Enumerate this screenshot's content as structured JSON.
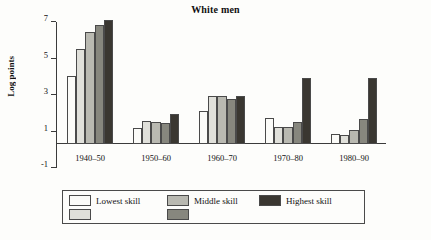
{
  "chart_data": {
    "type": "bar",
    "title": "White men",
    "xlabel": "",
    "ylabel": "Log points",
    "ylim": [
      -1,
      7
    ],
    "yticks": [
      -1,
      1,
      3,
      5,
      7
    ],
    "ytick_labels": [
      "-1",
      "1",
      "3",
      "5",
      "7"
    ],
    "grid": false,
    "legend_position": "bottom",
    "categories": [
      "1940–50",
      "1950–60",
      "1960–70",
      "1970–80",
      "1980–90"
    ],
    "series": [
      {
        "name": "Lowest skill",
        "color": "#fbfbf8",
        "values": [
          3.7,
          0.85,
          1.8,
          1.4,
          0.55
        ]
      },
      {
        "name": "Skill 2",
        "color": "#e0e0da",
        "values": [
          5.2,
          1.25,
          2.6,
          0.9,
          0.45
        ]
      },
      {
        "name": "Middle skill",
        "color": "#b9b9b1",
        "values": [
          6.1,
          1.2,
          2.6,
          0.9,
          0.75
        ]
      },
      {
        "name": "Skill 4",
        "color": "#87877e",
        "values": [
          6.5,
          1.15,
          2.45,
          1.2,
          1.35
        ]
      },
      {
        "name": "Highest skill",
        "color": "#3a3731",
        "values": [
          6.8,
          1.6,
          2.6,
          3.6,
          3.6
        ]
      }
    ],
    "legend_entries": [
      {
        "label": "Lowest skill",
        "color": "#fbfbf8"
      },
      {
        "label": "",
        "color": "#e0e0da"
      },
      {
        "label": "Middle skill",
        "color": "#b9b9b1"
      },
      {
        "label": "",
        "color": "#87877e"
      },
      {
        "label": "Highest skill",
        "color": "#3a3731"
      }
    ]
  }
}
